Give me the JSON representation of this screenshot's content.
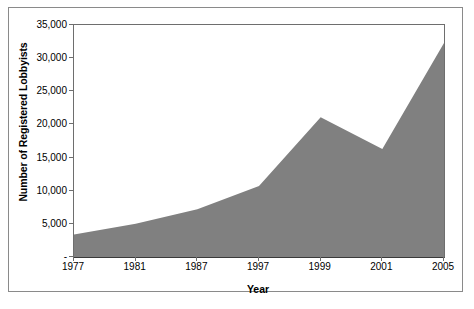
{
  "chart_data": {
    "type": "area",
    "title": "",
    "xlabel": "Year",
    "ylabel": "Number of Registered Lobbyists",
    "categories": [
      "1977",
      "1981",
      "1987",
      "1997",
      "1999",
      "2001",
      "2005"
    ],
    "values": [
      3400,
      5000,
      7200,
      10700,
      21100,
      16300,
      32300
    ],
    "series": [
      {
        "name": "Number of Registered Lobbyists",
        "values": [
          3400,
          5000,
          7200,
          10700,
          21100,
          16300,
          32300
        ]
      }
    ],
    "ylim": [
      0,
      35000
    ],
    "ytick_values": [
      0,
      5000,
      10000,
      15000,
      20000,
      25000,
      30000,
      35000
    ],
    "ytick_labels": [
      "-",
      "5,000",
      "10,000",
      "15,000",
      "20,000",
      "25,000",
      "30,000",
      "35,000"
    ],
    "xtick_labels": [
      "1977",
      "1981",
      "1987",
      "1997",
      "1999",
      "2001",
      "2005"
    ],
    "grid": false,
    "legend": false,
    "legend_position": "none",
    "colors": {
      "area_fill": "#808080",
      "axis_line": "#6e6e6e",
      "baseline": "#3a3a3a",
      "text": "#000000",
      "frame": "#8a8a8a",
      "background": "#ffffff"
    }
  }
}
